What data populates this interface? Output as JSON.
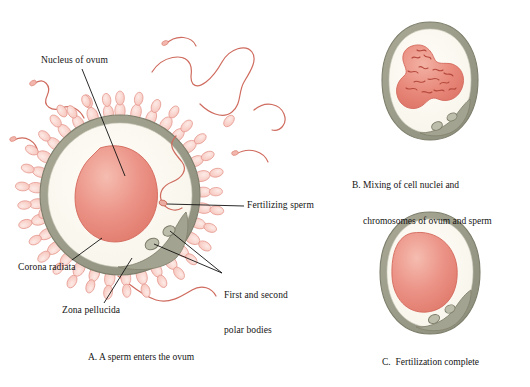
{
  "figure": {
    "background_color": "#ffffff"
  },
  "palette": {
    "nucleus_fill": "#e9897d",
    "nucleus_light": "#f2b3a6",
    "nucleus_edge": "#d4695c",
    "cytoplasm": "#fbf9f1",
    "zona_pellucida": "#9b9b89",
    "zona_edge": "#7e7e6c",
    "corona_cell_fill": "#f7c9c1",
    "corona_cell_edge": "#e4948a",
    "sperm_tail": "#cf6b5e",
    "polar_body_fill": "#b5b5a2",
    "leader_line": "#111111",
    "chromosome": "#b4483c",
    "text": "#141414"
  },
  "panels": [
    {
      "id": "A",
      "caption": "A. A sperm enters the ovum",
      "structures": [
        "corona radiata",
        "zona pellucida",
        "cytoplasm",
        "nucleus of ovum",
        "fertilizing sperm",
        "first and second polar bodies",
        "free sperm"
      ]
    },
    {
      "id": "B",
      "caption_line1": "B. Mixing of cell nuclei and",
      "caption_line2": "chromosomes of ovum and sperm",
      "structures": [
        "zona pellucida",
        "cytoplasm",
        "fused nucleus with chromosomes",
        "polar bodies"
      ]
    },
    {
      "id": "C",
      "caption": "C.  Fertilization complete",
      "structures": [
        "zona pellucida",
        "cytoplasm",
        "zygote nucleus",
        "polar bodies"
      ]
    }
  ],
  "labels": {
    "nucleus_of_ovum": "Nucleus of ovum",
    "fertilizing_sperm": "Fertilizing sperm",
    "corona_radiata": "Corona radiata",
    "zona_pellucida": "Zona pellucida",
    "polar_bodies_line1": "First and second",
    "polar_bodies_line2": "polar bodies"
  },
  "captions": {
    "panel_a": "A. A sperm enters the ovum",
    "panel_b_line1": "B. Mixing of cell nuclei and",
    "panel_b_line2": "chromosomes of ovum and sperm",
    "panel_c": "C.  Fertilization complete"
  }
}
